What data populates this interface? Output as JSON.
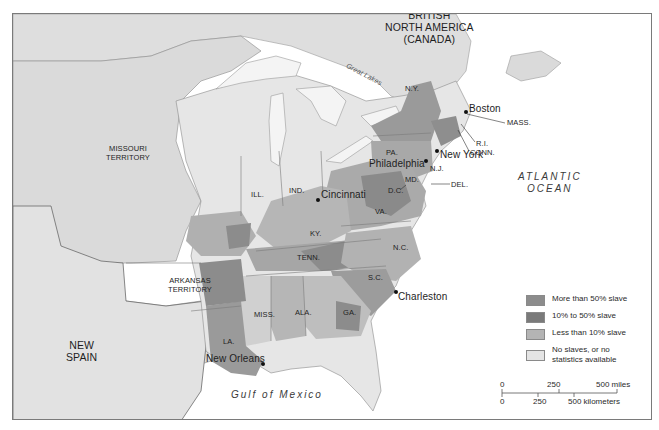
{
  "map": {
    "regions": {
      "canada": "BRITISH\nNORTH AMERICA\n(CANADA)",
      "missouri_territory": "MISSOURI\nTERRITORY",
      "arkansas_territory": "ARKANSAS\nTERRITORY",
      "new_spain": "NEW\nSPAIN"
    },
    "water": {
      "great_lakes": "Great Lakes",
      "atlantic": "ATLANTIC\nOCEAN",
      "gulf": "Gulf of Mexico"
    },
    "states": [
      "N.Y.",
      "PA.",
      "N.J.",
      "MD.",
      "D.C.",
      "DEL.",
      "VA.",
      "N.C.",
      "S.C.",
      "GA.",
      "ALA.",
      "MISS.",
      "LA.",
      "TENN.",
      "KY.",
      "ILL.",
      "IND.",
      "MASS.",
      "R.I.",
      "CONN."
    ],
    "cities": [
      "Boston",
      "New York",
      "Philadelphia",
      "Cincinnati",
      "Charleston",
      "New Orleans"
    ]
  },
  "legend": {
    "items": [
      {
        "label": "More than 50% slave",
        "color": "#8c8c8c"
      },
      {
        "label": "10% to 50% slave",
        "color": "#7a7a7a"
      },
      {
        "label": "Less than 10% slave",
        "color": "#b4b4b4"
      },
      {
        "label": "No slaves, or no statistics available",
        "color": "#e4e4e4"
      }
    ]
  },
  "scale": {
    "miles": [
      "0",
      "250",
      "500 miles"
    ],
    "kilometers": [
      "0",
      "250",
      "500 kilometers"
    ]
  },
  "colors": {
    "land_free": "#e6e6e6",
    "land_territory": "#dcdcdc",
    "water": "#ffffff",
    "over50": "#8c8c8c",
    "tenTo50": "#7a7a7a",
    "under10": "#b4b4b4"
  }
}
